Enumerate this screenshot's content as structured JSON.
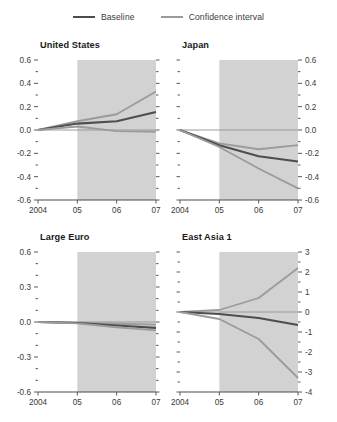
{
  "legend": {
    "items": [
      {
        "label": "Baseline",
        "color": "#4d4d4d",
        "name": "legend-baseline"
      },
      {
        "label": "Confidence interval",
        "color": "#9b9b9b",
        "name": "legend-confidence-interval"
      }
    ]
  },
  "colors": {
    "baseline": "#4d4d4d",
    "confidence": "#9b9b9b",
    "shade": "#d2d2d2",
    "axis": "#4a4a4a",
    "text": "#333333"
  },
  "chart_data": [
    {
      "type": "line",
      "title": "United States",
      "xlabel": "",
      "ylabel": "",
      "x": [
        2004,
        2005,
        2006,
        2007
      ],
      "xtick_labels": [
        "2004",
        "05",
        "06",
        "07"
      ],
      "ylim": [
        -0.6,
        0.6
      ],
      "ytick_labels": [
        "0.6",
        "0.4",
        "0.2",
        "0.0",
        "-0.2",
        "-0.4",
        "-0.6"
      ],
      "ytick_values": [
        0.6,
        0.4,
        0.2,
        0.0,
        -0.2,
        -0.4,
        -0.6
      ],
      "yaxis_side": "left",
      "minor_ticks_between": 1,
      "grid": false,
      "legend_position": "top-center",
      "shaded_region": {
        "from": 2005,
        "to": 2007,
        "color": "#d2d2d2"
      },
      "zero_line": true,
      "series": [
        {
          "name": "Confidence interval upper",
          "style": "confidence",
          "values": [
            0.0,
            0.075,
            0.135,
            0.33
          ]
        },
        {
          "name": "Baseline",
          "style": "baseline",
          "values": [
            0.0,
            0.055,
            0.075,
            0.155
          ]
        },
        {
          "name": "Confidence interval lower",
          "style": "confidence",
          "values": [
            0.0,
            0.03,
            -0.01,
            -0.015
          ]
        }
      ]
    },
    {
      "type": "line",
      "title": "Japan",
      "xlabel": "",
      "ylabel": "",
      "x": [
        2004,
        2005,
        2006,
        2007
      ],
      "xtick_labels": [
        "2004",
        "05",
        "06",
        "07"
      ],
      "ylim": [
        -0.6,
        0.6
      ],
      "ytick_labels": [
        "0.6",
        "0.4",
        "0.2",
        "0.0",
        "-0.2",
        "-0.4",
        "-0.6"
      ],
      "ytick_values": [
        0.6,
        0.4,
        0.2,
        0.0,
        -0.2,
        -0.4,
        -0.6
      ],
      "yaxis_side": "right",
      "minor_ticks_between": 1,
      "grid": false,
      "legend_position": "top-center",
      "shaded_region": {
        "from": 2005,
        "to": 2007,
        "color": "#d2d2d2"
      },
      "zero_line": true,
      "series": [
        {
          "name": "Confidence interval upper",
          "style": "confidence",
          "values": [
            0.0,
            -0.115,
            -0.165,
            -0.13
          ]
        },
        {
          "name": "Baseline",
          "style": "baseline",
          "values": [
            0.0,
            -0.13,
            -0.225,
            -0.27
          ]
        },
        {
          "name": "Confidence interval lower",
          "style": "confidence",
          "values": [
            0.0,
            -0.145,
            -0.33,
            -0.5
          ]
        }
      ]
    },
    {
      "type": "line",
      "title": "Large Euro",
      "xlabel": "",
      "ylabel": "",
      "x": [
        2004,
        2005,
        2006,
        2007
      ],
      "xtick_labels": [
        "2004",
        "05",
        "06",
        "07"
      ],
      "ylim": [
        -0.6,
        0.6
      ],
      "ytick_labels": [
        "0.6",
        "0.3",
        "0.0",
        "-0.3",
        "-0.6"
      ],
      "ytick_values": [
        0.6,
        0.3,
        0.0,
        -0.3,
        -0.6
      ],
      "yaxis_side": "left",
      "minor_ticks_between": 2,
      "grid": false,
      "legend_position": "top-center",
      "shaded_region": {
        "from": 2005,
        "to": 2007,
        "color": "#d2d2d2"
      },
      "zero_line": true,
      "series": [
        {
          "name": "Confidence interval upper",
          "style": "confidence",
          "values": [
            0.0,
            -0.005,
            -0.015,
            -0.022
          ]
        },
        {
          "name": "Baseline",
          "style": "baseline",
          "values": [
            0.0,
            -0.008,
            -0.03,
            -0.05
          ]
        },
        {
          "name": "Confidence interval lower",
          "style": "confidence",
          "values": [
            0.0,
            -0.012,
            -0.045,
            -0.072
          ]
        }
      ]
    },
    {
      "type": "line",
      "title": "East Asia 1",
      "xlabel": "",
      "ylabel": "",
      "x": [
        2004,
        2005,
        2006,
        2007
      ],
      "xtick_labels": [
        "2004",
        "05",
        "06",
        "07"
      ],
      "ylim": [
        -4,
        3
      ],
      "ytick_labels": [
        "3",
        "2",
        "1",
        "0",
        "-1",
        "-2",
        "-3",
        "-4"
      ],
      "ytick_values": [
        3,
        2,
        1,
        0,
        -1,
        -2,
        -3,
        -4
      ],
      "yaxis_side": "right",
      "minor_ticks_between": 1,
      "grid": false,
      "legend_position": "top-center",
      "shaded_region": {
        "from": 2005,
        "to": 2007,
        "color": "#d2d2d2"
      },
      "zero_line": true,
      "series": [
        {
          "name": "Confidence interval upper",
          "style": "confidence",
          "values": [
            0.0,
            0.1,
            0.7,
            2.2
          ]
        },
        {
          "name": "Baseline",
          "style": "baseline",
          "values": [
            0.0,
            -0.1,
            -0.3,
            -0.65
          ]
        },
        {
          "name": "Confidence interval lower",
          "style": "confidence",
          "values": [
            0.0,
            -0.35,
            -1.35,
            -3.3
          ]
        }
      ]
    }
  ]
}
